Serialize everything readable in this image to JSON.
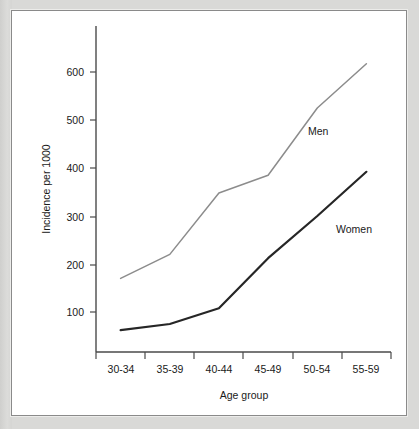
{
  "chart_data": {
    "type": "line",
    "title": "",
    "xlabel": "Age group",
    "ylabel": "Incidence per 1000",
    "categories": [
      "30-34",
      "35-39",
      "40-44",
      "45-49",
      "50-54",
      "55-59"
    ],
    "yticks": [
      100,
      200,
      300,
      400,
      500,
      600
    ],
    "ytick_labels": [
      "100",
      "200",
      "300",
      "400",
      "500",
      "600"
    ],
    "ylim": [
      0,
      700
    ],
    "grid": false,
    "legend_position": "inline-annotation",
    "series": [
      {
        "name": "Men",
        "color": "#8c8c8c",
        "values": [
          170,
          220,
          348,
          385,
          525,
          617
        ]
      },
      {
        "name": "Women",
        "color": "#262626",
        "values": [
          62,
          75,
          108,
          212,
          300,
          392
        ]
      }
    ],
    "annotations": [
      {
        "text": "Men",
        "series": "Men",
        "x_value": 4.35,
        "y_value": 495
      },
      {
        "text": "Women",
        "series": "Women",
        "x_value": 4.6,
        "y_value": 282
      }
    ]
  },
  "axes": {
    "x_axis_title": "Age group",
    "y_axis_title": "Incidence per 1000"
  }
}
